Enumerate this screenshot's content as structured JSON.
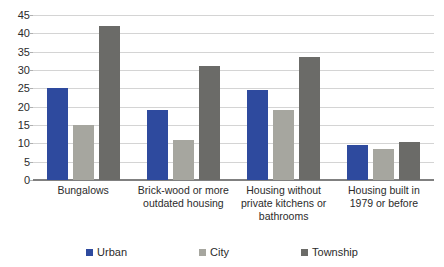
{
  "chart_data": {
    "type": "bar",
    "title": "",
    "subtitle": "",
    "xlabel": "",
    "ylabel": "",
    "ylim": [
      0,
      45
    ],
    "ytick_step": 5,
    "yticks": [
      0,
      5,
      10,
      15,
      20,
      25,
      30,
      35,
      40,
      45
    ],
    "grid": true,
    "grid_axis": "y",
    "legend_position": "bottom",
    "grouping": "grouped",
    "categories": [
      "Bungalows",
      "Brick-wood or more outdated housing",
      "Housing without private kitchens or bathrooms",
      "Housing built in 1979 or before"
    ],
    "series": [
      {
        "name": "Urban",
        "color": "#2e4a9e",
        "values": [
          25.0,
          19.0,
          24.5,
          9.5
        ]
      },
      {
        "name": "City",
        "color": "#a6a69f",
        "values": [
          15.0,
          11.0,
          19.0,
          8.5
        ]
      },
      {
        "name": "Township",
        "color": "#6b6b68",
        "values": [
          42.0,
          31.0,
          33.5,
          10.5
        ]
      }
    ]
  },
  "axis": {
    "y_tick_labels": [
      "0",
      "5",
      "10",
      "15",
      "20",
      "25",
      "30",
      "35",
      "40",
      "45"
    ]
  },
  "legend": {
    "items": [
      {
        "label": "Urban",
        "color": "#2e4a9e"
      },
      {
        "label": "City",
        "color": "#a6a69f"
      },
      {
        "label": "Township",
        "color": "#6b6b68"
      }
    ]
  },
  "colors": {
    "urban": "#2e4a9e",
    "city": "#a6a69f",
    "township": "#6b6b68",
    "gridline": "#d4d4d4",
    "baseline": "#808080",
    "text": "#2b2b2b",
    "background": "#ffffff"
  }
}
